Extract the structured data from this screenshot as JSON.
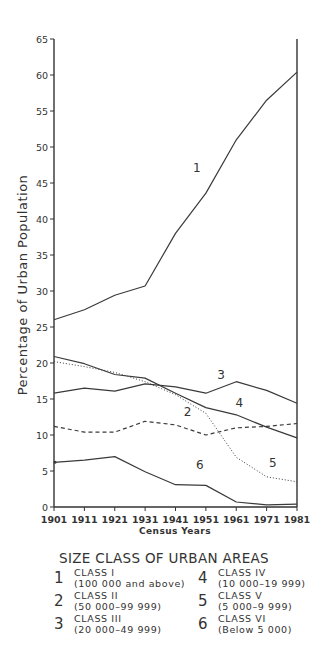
{
  "chart_data": {
    "type": "line",
    "title": "",
    "xlabel": "Census Years",
    "ylabel": "Percentage of Urban Population",
    "ylim": [
      0,
      65
    ],
    "yticks": [
      0,
      5,
      10,
      15,
      20,
      25,
      30,
      35,
      40,
      45,
      50,
      55,
      60,
      65
    ],
    "grid": false,
    "categories": [
      "1901",
      "1911",
      "1921",
      "1931",
      "1941",
      "1951",
      "1961",
      "1971",
      "1981"
    ],
    "series": [
      {
        "name": "1",
        "class": "CLASS I",
        "range": "(100 000 and above)",
        "style": "solid",
        "values": [
          26.0,
          27.4,
          29.4,
          30.7,
          38.0,
          43.6,
          51.0,
          56.5,
          60.4
        ]
      },
      {
        "name": "2",
        "class": "CLASS II",
        "range": "(50 000–99 999)",
        "style": "dashed",
        "values": [
          11.2,
          10.4,
          10.4,
          11.9,
          11.4,
          10.0,
          11.0,
          11.2,
          11.6
        ]
      },
      {
        "name": "3",
        "class": "CLASS III",
        "range": "(20 000–49 999)",
        "style": "solid",
        "values": [
          15.8,
          16.5,
          16.1,
          17.1,
          16.7,
          15.8,
          17.4,
          16.2,
          14.4
        ]
      },
      {
        "name": "4",
        "class": "CLASS IV",
        "range": "(10 000–19 999)",
        "style": "solid",
        "values": [
          20.9,
          19.9,
          18.4,
          17.9,
          15.8,
          13.8,
          12.8,
          11.1,
          9.6
        ]
      },
      {
        "name": "5",
        "class": "CLASS V",
        "range": "(5 000–9 999)",
        "style": "dotted",
        "values": [
          20.2,
          19.5,
          18.7,
          17.4,
          15.6,
          13.0,
          6.9,
          4.2,
          3.5
        ]
      },
      {
        "name": "6",
        "class": "CLASS VI",
        "range": "(Below 5 000)",
        "style": "solid",
        "values": [
          6.2,
          6.5,
          7.0,
          4.9,
          3.1,
          3.0,
          0.7,
          0.3,
          0.4
        ]
      }
    ],
    "line_labels": [
      {
        "text": "1",
        "x_year": 1948,
        "y": 46.5
      },
      {
        "text": "2",
        "x_year": 1945,
        "y": 12.6
      },
      {
        "text": "3",
        "x_year": 1956,
        "y": 17.8
      },
      {
        "text": "4",
        "x_year": 1962,
        "y": 13.9
      },
      {
        "text": "5",
        "x_year": 1973,
        "y": 5.6
      },
      {
        "text": "6",
        "x_year": 1949,
        "y": 5.3
      }
    ],
    "legend_title": "SIZE CLASS OF URBAN AREAS",
    "legend_position": "bottom"
  },
  "colors": {
    "line": "#3a3a3a",
    "axis": "#333333",
    "text": "#333333"
  }
}
